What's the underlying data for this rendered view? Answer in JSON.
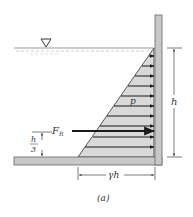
{
  "diagram": {
    "labels": {
      "pressure": "p",
      "resultant_force": "F",
      "resultant_force_subscript": "R",
      "depth": "h",
      "centroid_h": "h",
      "centroid_den": "3",
      "base_pressure": "γh",
      "caption": "(a)"
    },
    "symbols": {
      "free_surface": "water-surface-triangle"
    },
    "colors": {
      "wall_fill": "#c8c8c8",
      "wall_stroke": "#666666",
      "pressure_fill": "#d9d9d9",
      "arrow": "#1a1a1a",
      "water_line": "#9a9a9a",
      "dimension": "#444444"
    },
    "pressure_arrows_count": 10
  }
}
